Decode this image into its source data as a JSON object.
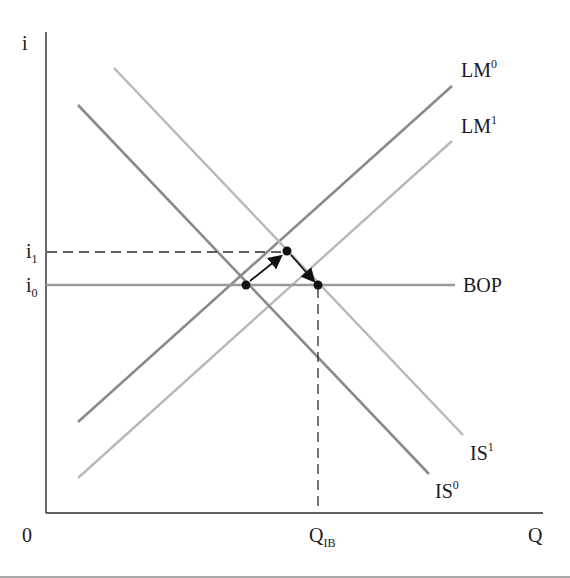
{
  "diagram": {
    "type": "IS-LM-BOP",
    "axes": {
      "y_label": "i",
      "x_label": "Q",
      "origin_label": "0"
    },
    "y_ticks": [
      {
        "base": "i",
        "sub": "1",
        "y": 252
      },
      {
        "base": "i",
        "sub": "0",
        "y": 285
      }
    ],
    "x_ticks": [
      {
        "base": "Q",
        "sub": "IB",
        "x": 318
      }
    ],
    "curves": [
      {
        "name": "LM",
        "sup": "0",
        "color": "#8a8a8a",
        "from": [
          78,
          422
        ],
        "to": [
          452,
          86
        ]
      },
      {
        "name": "LM",
        "sup": "1",
        "color": "#b4b4b4",
        "from": [
          78,
          478
        ],
        "to": [
          452,
          141
        ]
      },
      {
        "name": "IS",
        "sup": "0",
        "color": "#8a8a8a",
        "from": [
          78,
          105
        ],
        "to": [
          429,
          474
        ]
      },
      {
        "name": "IS",
        "sup": "1",
        "color": "#b4b4b4",
        "from": [
          114,
          68
        ],
        "to": [
          463,
          435
        ]
      },
      {
        "name": "BOP",
        "sup": "",
        "color": "#9a9a9a",
        "from": [
          46,
          285
        ],
        "to": [
          455,
          285
        ]
      }
    ],
    "labels": {
      "lm0": {
        "base": "LM",
        "sup": "0"
      },
      "lm1": {
        "base": "LM",
        "sup": "1"
      },
      "is0": {
        "base": "IS",
        "sup": "0"
      },
      "is1": {
        "base": "IS",
        "sup": "1"
      },
      "bop": {
        "base": "BOP"
      }
    },
    "points": [
      {
        "id": "initial-equilibrium",
        "x": 246,
        "y": 285
      },
      {
        "id": "intermediate-equilibrium",
        "x": 287,
        "y": 251
      },
      {
        "id": "final-equilibrium",
        "x": 318,
        "y": 285
      }
    ],
    "arrows": [
      {
        "from": "initial-equilibrium",
        "to": "intermediate-equilibrium"
      },
      {
        "from": "intermediate-equilibrium",
        "to": "final-equilibrium"
      }
    ],
    "colors": {
      "axis": "#2a2a2a",
      "dashed": "#2a2a2a",
      "point": "#111111"
    }
  }
}
